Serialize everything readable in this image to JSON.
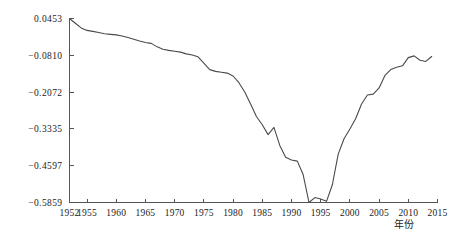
{
  "chart_data": {
    "type": "line",
    "title": "",
    "subtitle": "",
    "xlabel": "年份",
    "ylabel": "",
    "xlim": [
      1952,
      2015
    ],
    "ylim": [
      -0.5859,
      0.0453
    ],
    "grid": false,
    "legend": null,
    "line_color": "#4a4a4a",
    "axis_color": "#555555",
    "x_ticks": [
      "1952",
      "1955",
      "1960",
      "1965",
      "1970",
      "1975",
      "1980",
      "1985",
      "1990",
      "1995",
      "2000",
      "2005",
      "2010",
      "2015"
    ],
    "x_tick_values": [
      1952,
      1955,
      1960,
      1965,
      1970,
      1975,
      1980,
      1985,
      1990,
      1995,
      2000,
      2005,
      2010,
      2015
    ],
    "y_ticks": [
      "0.0453",
      "-0.0810",
      "-0.2072",
      "-0.3335",
      "-0.4597",
      "-0.5859"
    ],
    "y_tick_values": [
      0.0453,
      -0.081,
      -0.2072,
      -0.3335,
      -0.4597,
      -0.5859
    ],
    "series": [
      {
        "name": "series-1",
        "x": [
          1952,
          1953,
          1954,
          1955,
          1956,
          1957,
          1958,
          1959,
          1960,
          1961,
          1962,
          1963,
          1964,
          1965,
          1966,
          1967,
          1968,
          1969,
          1970,
          1971,
          1972,
          1973,
          1974,
          1975,
          1976,
          1977,
          1978,
          1979,
          1980,
          1981,
          1982,
          1983,
          1984,
          1985,
          1986,
          1987,
          1988,
          1989,
          1990,
          1991,
          1992,
          1993,
          1994,
          1995,
          1996,
          1997,
          1998,
          1999,
          2000,
          2001,
          2002,
          2003,
          2004,
          2005,
          2006,
          2007,
          2008,
          2009,
          2010,
          2011,
          2012,
          2013,
          2014
        ],
        "y": [
          0.0453,
          0.029,
          0.013,
          0.0045,
          0.001,
          -0.003,
          -0.007,
          -0.009,
          -0.011,
          -0.015,
          -0.02,
          -0.026,
          -0.032,
          -0.037,
          -0.04,
          -0.052,
          -0.06,
          -0.064,
          -0.067,
          -0.07,
          -0.076,
          -0.08,
          -0.086,
          -0.108,
          -0.13,
          -0.136,
          -0.139,
          -0.142,
          -0.152,
          -0.175,
          -0.207,
          -0.248,
          -0.291,
          -0.319,
          -0.353,
          -0.328,
          -0.39,
          -0.431,
          -0.44,
          -0.444,
          -0.49,
          -0.5859,
          -0.569,
          -0.574,
          -0.582,
          -0.525,
          -0.42,
          -0.367,
          -0.334,
          -0.298,
          -0.248,
          -0.217,
          -0.214,
          -0.193,
          -0.15,
          -0.13,
          -0.122,
          -0.117,
          -0.089,
          -0.083,
          -0.098,
          -0.102,
          -0.085
        ]
      }
    ]
  },
  "axis_titles": {
    "x": "年份"
  },
  "caption": {
    "partial_text": ""
  }
}
